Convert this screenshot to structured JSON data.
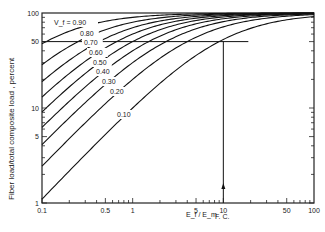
{
  "chart_data": {
    "type": "line",
    "title": "",
    "xlabel": "E_f / E_m",
    "ylabel": "Fiber load/total composite load , percent",
    "xscale": "log",
    "yscale": "log",
    "xlim": [
      0.1,
      100
    ],
    "ylim": [
      1,
      100
    ],
    "x_ticks": [
      "0.1",
      "0.5",
      "1",
      "5",
      "10",
      "50",
      "100"
    ],
    "y_ticks": [
      "1",
      "5",
      "10",
      "50",
      "100"
    ],
    "grid": false,
    "legend": "inline curve labels",
    "annotations": [
      {
        "text": "F. C.",
        "x": 10,
        "note": "vertical arrow at Ef/Em = 10"
      },
      {
        "text": "horizontal reference line at 50%"
      }
    ],
    "series": [
      {
        "name": "Vf = 0.90",
        "label": "V_f = 0.90"
      },
      {
        "name": "0.80",
        "label": "0.80"
      },
      {
        "name": "0.70",
        "label": "0.70"
      },
      {
        "name": "0.60",
        "label": "0.60"
      },
      {
        "name": "0.50",
        "label": "0.50"
      },
      {
        "name": "0.40",
        "label": "0.40"
      },
      {
        "name": "0.30",
        "label": "0.30"
      },
      {
        "name": "0.20",
        "label": "0.20"
      },
      {
        "name": "0.10",
        "label": "0.10"
      }
    ],
    "vf_values": [
      0.9,
      0.8,
      0.7,
      0.6,
      0.5,
      0.4,
      0.3,
      0.2,
      0.1
    ],
    "sample_points": {
      "x": [
        0.1,
        0.5,
        1,
        5,
        10,
        50,
        100
      ],
      "0.90": [
        47.4,
        81.8,
        90.0,
        97.8,
        98.9,
        99.8,
        99.9
      ],
      "0.10": [
        1.1,
        5.3,
        10.0,
        35.7,
        52.6,
        84.7,
        91.7
      ]
    }
  }
}
